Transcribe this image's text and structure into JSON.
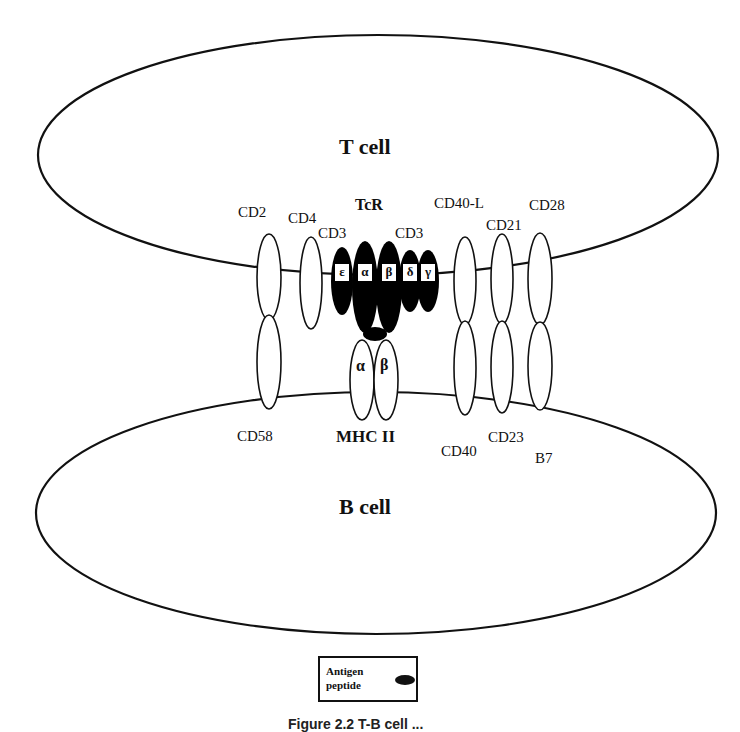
{
  "diagram": {
    "t_cell": {
      "label": "T cell"
    },
    "b_cell": {
      "label": "B cell"
    },
    "t_cell_molecules": {
      "cd2": "CD2",
      "cd4": "CD4",
      "tcr": "TcR",
      "cd3_left": "CD3",
      "cd3_right": "CD3",
      "cd40l": "CD40-L",
      "cd21": "CD21",
      "cd28": "CD28"
    },
    "tcr_chains": [
      "ε",
      "α",
      "β",
      "δ",
      "γ"
    ],
    "b_cell_molecules": {
      "cd58": "CD58",
      "mhc2": "MHC II",
      "cd40": "CD40",
      "cd23": "CD23",
      "b7": "B7"
    },
    "mhc_chains": [
      "α",
      "β"
    ],
    "legend": {
      "line1": "Antigen",
      "line2": "peptide",
      "symbol": "filled-black-ellipse"
    },
    "caption": "Figure 2.2  T-B cell ..."
  }
}
